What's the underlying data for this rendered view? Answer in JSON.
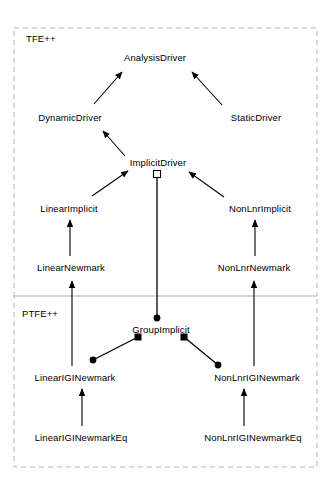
{
  "diagram": {
    "type": "uml-class-diagram",
    "width": 331,
    "height": 495,
    "background_color": "#ffffff",
    "line_color": "#000000",
    "package_border_color": "#b0b0b0",
    "packages": [
      {
        "name": "package-tfe",
        "label": "TFE++",
        "label_x": 26,
        "label_y": 40,
        "box": {
          "x": 14,
          "y": 28,
          "w": 303,
          "h": 268
        }
      },
      {
        "name": "package-ptfe",
        "label": "PTFE++",
        "label_x": 22,
        "label_y": 315,
        "box": {
          "x": 14,
          "y": 296,
          "w": 303,
          "h": 171
        }
      }
    ],
    "classes": [
      {
        "id": "analysis-driver",
        "label": "AnalysisDriver",
        "x": 155,
        "y": 57
      },
      {
        "id": "dynamic-driver",
        "label": "DynamicDriver",
        "x": 70,
        "y": 117
      },
      {
        "id": "static-driver",
        "label": "StaticDriver",
        "x": 256,
        "y": 117
      },
      {
        "id": "implicit-driver",
        "label": "ImplicitDriver",
        "x": 158,
        "y": 162
      },
      {
        "id": "linear-implicit",
        "label": "LinearImplicit",
        "x": 69,
        "y": 208
      },
      {
        "id": "non-lnr-implicit",
        "label": "NonLnrImplicit",
        "x": 260,
        "y": 208
      },
      {
        "id": "linear-newmark",
        "label": "LinearNewmark",
        "x": 71,
        "y": 267
      },
      {
        "id": "non-lnr-newmark",
        "label": "NonLnrNewmark",
        "x": 254,
        "y": 267
      },
      {
        "id": "group-implicit",
        "label": "GroupImplicit",
        "x": 161,
        "y": 329
      },
      {
        "id": "linear-igi-newmark",
        "label": "LinearIGINewmark",
        "x": 75,
        "y": 377
      },
      {
        "id": "non-lnr-igi-newmark",
        "label": "NonLnrIGINewmark",
        "x": 257,
        "y": 377
      },
      {
        "id": "linear-igi-newmark-eq",
        "label": "LinearIGINewmarkEq",
        "x": 81,
        "y": 437
      },
      {
        "id": "non-lnr-igi-newmark-eq",
        "label": "NonLnrIGINewmarkEq",
        "x": 253,
        "y": 437
      }
    ],
    "relationships": [
      {
        "id": "rel-dynamic-to-analysis",
        "kind": "inheritance",
        "from": "DynamicDriver",
        "to": "AnalysisDriver"
      },
      {
        "id": "rel-static-to-analysis",
        "kind": "inheritance",
        "from": "StaticDriver",
        "to": "AnalysisDriver"
      },
      {
        "id": "rel-implicit-to-dynamic",
        "kind": "inheritance",
        "from": "ImplicitDriver",
        "to": "DynamicDriver"
      },
      {
        "id": "rel-linimp-to-implicit",
        "kind": "inheritance",
        "from": "LinearImplicit",
        "to": "ImplicitDriver"
      },
      {
        "id": "rel-nlimp-to-implicit",
        "kind": "inheritance",
        "from": "NonLnrImplicit",
        "to": "ImplicitDriver"
      },
      {
        "id": "rel-linnew-to-linimp",
        "kind": "inheritance",
        "from": "LinearNewmark",
        "to": "LinearImplicit"
      },
      {
        "id": "rel-nlnew-to-nlimp",
        "kind": "inheritance",
        "from": "NonLnrNewmark",
        "to": "NonLnrImplicit"
      },
      {
        "id": "rel-lingi-to-linnew",
        "kind": "inheritance",
        "from": "LinearIGINewmark",
        "to": "LinearNewmark"
      },
      {
        "id": "rel-nlgi-to-nlnew",
        "kind": "inheritance",
        "from": "NonLnrIGINewmark",
        "to": "NonLnrNewmark"
      },
      {
        "id": "rel-lingieq-to-lingi",
        "kind": "inheritance",
        "from": "LinearIGINewmarkEq",
        "to": "LinearIGINewmark"
      },
      {
        "id": "rel-nlgieq-to-nlgi",
        "kind": "inheritance",
        "from": "NonLnrIGINewmarkEq",
        "to": "NonLnrIGINewmark"
      },
      {
        "id": "rel-group-to-implicit",
        "kind": "aggregation",
        "from": "GroupImplicit",
        "to": "ImplicitDriver",
        "aggregation_end_marker": "hollow-square",
        "source_end_marker": "filled-circle"
      },
      {
        "id": "rel-group-to-lingi",
        "kind": "composition",
        "from": "GroupImplicit",
        "to": "LinearIGINewmark",
        "composition_end_marker": "filled-square",
        "target_end_marker": "filled-circle"
      },
      {
        "id": "rel-group-to-nlgi",
        "kind": "composition",
        "from": "GroupImplicit",
        "to": "NonLnrIGINewmark",
        "composition_end_marker": "filled-square",
        "target_end_marker": "filled-circle"
      }
    ]
  }
}
